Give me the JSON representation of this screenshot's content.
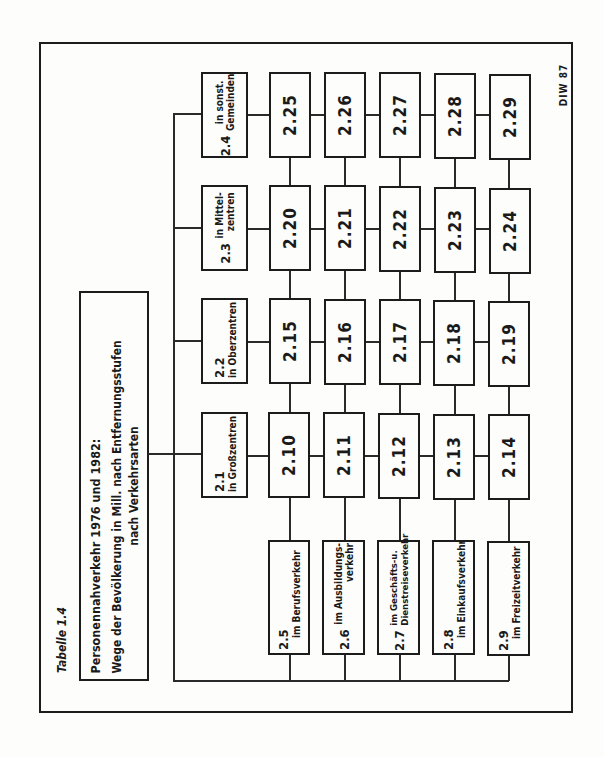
{
  "figure": {
    "label": "Tabelle 1.4",
    "source_tag": "DIW 87",
    "orientation": "rotated 90° counter-clockwise"
  },
  "title": {
    "line1": "Personennahverkehr 1976 und 1982:",
    "line2": "Wege der Bevölkerung in Mill. nach Entfernungsstufen",
    "line3": "nach Verkehrsarten"
  },
  "locations": [
    {
      "num": "2.1",
      "text": "in Großzentren"
    },
    {
      "num": "2.2",
      "text": "in Oberzentren"
    },
    {
      "num": "2.3",
      "text": "in Mittel-\nzentren"
    },
    {
      "num": "2.4",
      "text": "in sonst.\nGemeinden"
    }
  ],
  "purposes": [
    {
      "num": "2.5",
      "text": "im Berufsverkehr"
    },
    {
      "num": "2.6",
      "text": "im Ausbildungs-\nverkehr"
    },
    {
      "num": "2.7",
      "text": "im Geschäfts-u.\nDienstreiseverkehr"
    },
    {
      "num": "2.8",
      "text": "im Einkaufsverkehr"
    },
    {
      "num": "2.9",
      "text": "im Freizeitverkehr"
    }
  ],
  "grid": {
    "row_2_1": [
      "2.10",
      "2.11",
      "2.12",
      "2.13",
      "2.14"
    ],
    "row_2_2": [
      "2.15",
      "2.16",
      "2.17",
      "2.18",
      "2.19"
    ],
    "row_2_3": [
      "2.20",
      "2.21",
      "2.22",
      "2.23",
      "2.24"
    ],
    "row_2_4": [
      "2.25",
      "2.26",
      "2.27",
      "2.28",
      "2.29"
    ]
  }
}
